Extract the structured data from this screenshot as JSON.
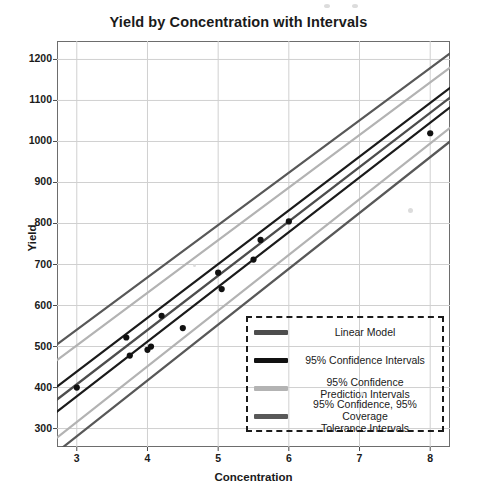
{
  "chart_data": {
    "type": "scatter",
    "title": "Yield by Concentration with Intervals",
    "xlabel": "Concentration",
    "ylabel": "Yield",
    "xlim": [
      2.72,
      8.28
    ],
    "ylim": [
      255,
      1245
    ],
    "xticks": [
      3,
      4,
      5,
      6,
      7,
      8
    ],
    "yticks": [
      300,
      400,
      500,
      600,
      700,
      800,
      900,
      1000,
      1100,
      1200
    ],
    "grid": true,
    "legend_position": "lower right",
    "points": [
      {
        "x": 3.0,
        "y": 400
      },
      {
        "x": 3.7,
        "y": 522
      },
      {
        "x": 3.75,
        "y": 478
      },
      {
        "x": 4.0,
        "y": 492
      },
      {
        "x": 4.05,
        "y": 500
      },
      {
        "x": 4.2,
        "y": 575
      },
      {
        "x": 4.5,
        "y": 545
      },
      {
        "x": 5.0,
        "y": 680
      },
      {
        "x": 5.05,
        "y": 640
      },
      {
        "x": 5.5,
        "y": 712
      },
      {
        "x": 5.6,
        "y": 760
      },
      {
        "x": 6.0,
        "y": 805
      },
      {
        "x": 8.0,
        "y": 1020
      }
    ],
    "series": [
      {
        "name": "Linear Model",
        "type": "line",
        "color": "#4d4d4d",
        "width": 2.4,
        "x": [
          2.72,
          8.28
        ],
        "y": [
          371,
          1107
        ]
      },
      {
        "name": "95% Confidence Intervals upper",
        "type": "line",
        "color": "#1b1b1b",
        "width": 2.2,
        "x": [
          2.72,
          8.28
        ],
        "y": [
          402,
          1131
        ]
      },
      {
        "name": "95% Confidence Intervals lower",
        "type": "line",
        "color": "#1b1b1b",
        "width": 2.2,
        "x": [
          2.72,
          8.28
        ],
        "y": [
          341,
          1083
        ]
      },
      {
        "name": "95% Confidence Prediction Intervals upper",
        "type": "line",
        "color": "#b3b3b3",
        "width": 2.2,
        "x": [
          2.72,
          8.28
        ],
        "y": [
          467,
          1180
        ]
      },
      {
        "name": "95% Confidence Prediction Intervals lower",
        "type": "line",
        "color": "#b3b3b3",
        "width": 2.2,
        "x": [
          2.72,
          8.28
        ],
        "y": [
          278,
          1033
        ]
      },
      {
        "name": "95% Confidence, 95% Coverage Tolerance Intervals upper",
        "type": "line",
        "color": "#585858",
        "width": 2.2,
        "x": [
          2.72,
          8.28
        ],
        "y": [
          505,
          1215
        ]
      },
      {
        "name": "95% Confidence, 95% Coverage Tolerance Intervals lower",
        "type": "line",
        "color": "#585858",
        "width": 2.2,
        "x": [
          2.72,
          8.28
        ],
        "y": [
          243,
          1000
        ]
      }
    ],
    "legend": [
      {
        "label_lines": [
          "Linear Model"
        ],
        "color": "#4d4d4d"
      },
      {
        "label_lines": [
          "95% Confidence Intervals"
        ],
        "color": "#111111"
      },
      {
        "label_lines": [
          "95% Confidence",
          "Prediction Intervals"
        ],
        "color": "#b3b3b3"
      },
      {
        "label_lines": [
          "95% Confidence, 95% Coverage",
          "Tolerance Intervals"
        ],
        "color": "#585858"
      }
    ]
  },
  "colors": {
    "frame": "#6d6d6d",
    "grid": "#d0d0d0",
    "point": "#111111",
    "text": "#1a1a1a",
    "background": "#ffffff"
  }
}
